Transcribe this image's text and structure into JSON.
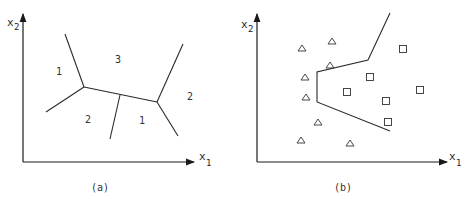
{
  "panel_a": {
    "caption": "(a)",
    "x_axis_label": "x",
    "x_axis_sub": "1",
    "y_axis_label": "x",
    "y_axis_sub": "2",
    "regions": [
      {
        "label": "1",
        "x": 59,
        "y": 74
      },
      {
        "label": "3",
        "x": 118,
        "y": 63
      },
      {
        "label": "2",
        "x": 190,
        "y": 99
      },
      {
        "label": "2",
        "x": 88,
        "y": 123
      },
      {
        "label": "1",
        "x": 142,
        "y": 124
      }
    ]
  },
  "panel_b": {
    "caption": "(b)",
    "x_axis_label": "x",
    "x_axis_sub": "1",
    "y_axis_label": "x",
    "y_axis_sub": "2",
    "class_triangle_points": [
      [
        302,
        48
      ],
      [
        332,
        41
      ],
      [
        330,
        65
      ],
      [
        305,
        77
      ],
      [
        306,
        97
      ],
      [
        318,
        122
      ],
      [
        301,
        140
      ],
      [
        350,
        143
      ]
    ],
    "class_square_points": [
      [
        403,
        49
      ],
      [
        370,
        77
      ],
      [
        347,
        92
      ],
      [
        386,
        101
      ],
      [
        420,
        90
      ],
      [
        388,
        122
      ]
    ]
  }
}
